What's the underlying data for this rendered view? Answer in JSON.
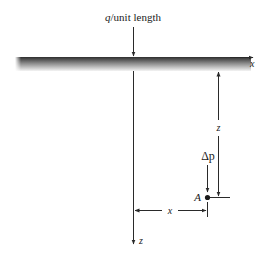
{
  "diagram": {
    "load_label_prefix": "q",
    "load_label_suffix": "/unit length",
    "surface_axis_label": "x",
    "depth_axis_label": "z",
    "depth_dimension_label": "z",
    "stress_increment_label": "Δp",
    "point_label": "A",
    "horizontal_distance_label": "x",
    "colors": {
      "line": "#2a2a2a",
      "ground_dark": "#2e2e2e",
      "ground_light": "#f2f2f2"
    }
  }
}
